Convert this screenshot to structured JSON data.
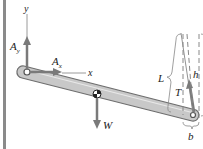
{
  "diagram": {
    "type": "free-body-diagram",
    "axes": {
      "x_label": "x",
      "y_label": "y"
    },
    "forces": [
      {
        "id": "Ay",
        "label": "A",
        "subscript": "y",
        "direction": "up",
        "location": "pin A"
      },
      {
        "id": "Ax",
        "label": "A",
        "subscript": "x",
        "direction": "right",
        "location": "pin A"
      },
      {
        "id": "W",
        "label": "W",
        "direction": "down",
        "location": "center of bar"
      },
      {
        "id": "T",
        "label": "T",
        "direction": "up (inclined along cable)",
        "location": "right end of bar"
      }
    ],
    "dimensions": [
      {
        "id": "L",
        "label": "L",
        "meaning": "cable length"
      },
      {
        "id": "h",
        "label": "h",
        "meaning": "vertical height"
      },
      {
        "id": "b",
        "label": "b",
        "meaning": "horizontal offset"
      }
    ],
    "colors": {
      "frame": "#8a8a8a",
      "bar_fill": "#c8c8c8",
      "bar_stroke": "#6e6e6e",
      "arrow": "#7a7a7a",
      "text": "#222222"
    }
  }
}
